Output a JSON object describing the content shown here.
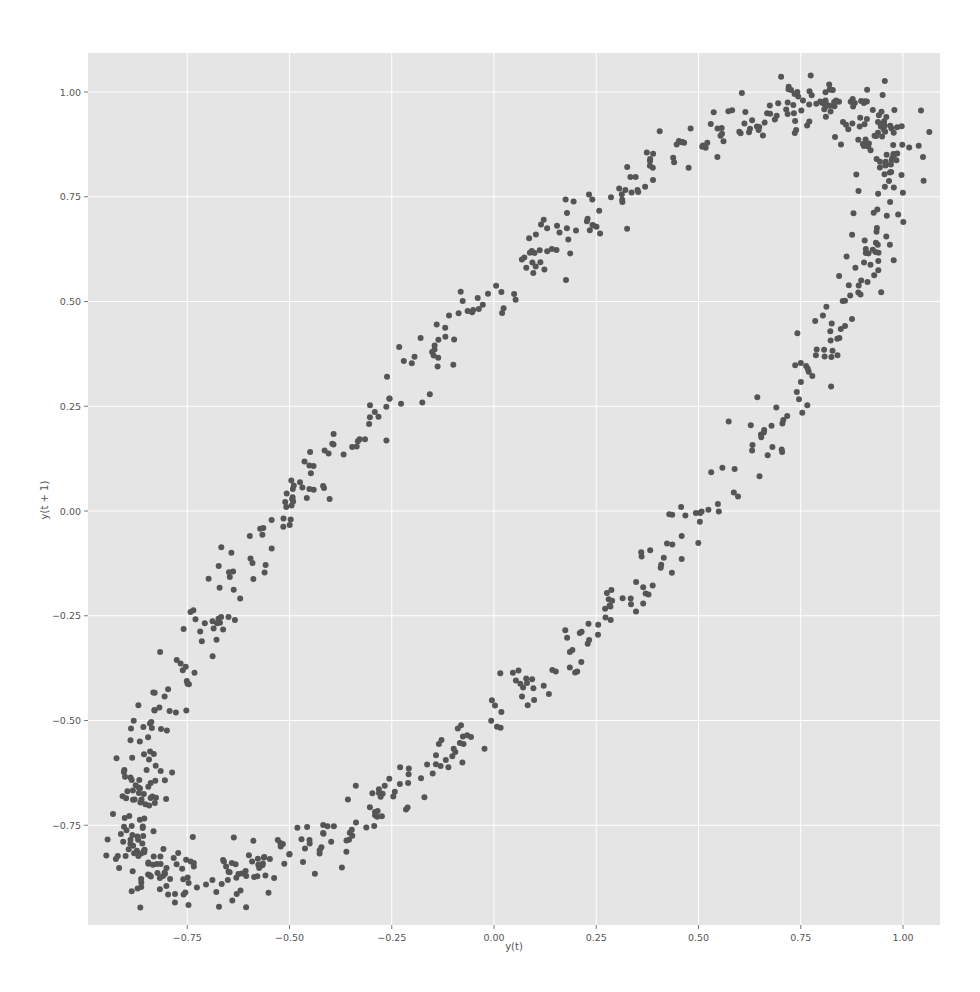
{
  "chart_data": {
    "type": "scatter",
    "title": "",
    "xlabel": "y(t)",
    "ylabel": "y(t + 1)",
    "xlim": [
      -0.96,
      1.09
    ],
    "ylim": [
      -0.98,
      1.09
    ],
    "grid": true,
    "legend": null,
    "x_ticks": [
      -0.75,
      -0.5,
      -0.25,
      0.0,
      0.25,
      0.5,
      0.75,
      1.0
    ],
    "x_tick_labels": [
      "−0.75",
      "−0.50",
      "−0.25",
      "0.00",
      "0.25",
      "0.50",
      "0.75",
      "1.00"
    ],
    "y_ticks": [
      -0.75,
      -0.5,
      -0.25,
      0.0,
      0.25,
      0.5,
      0.75,
      1.0
    ],
    "y_tick_labels": [
      "−0.75",
      "−0.50",
      "−0.25",
      "0.00",
      "0.25",
      "0.50",
      "0.75",
      "1.00"
    ],
    "series": [
      {
        "name": "lag plot",
        "description": "Lag-1 plot of a noisy sinusoid: points lie on a tilted elliptical loop, x = y(t), y = y(t+1)",
        "n_points": 800,
        "model": {
          "amplitude": 0.93,
          "x_offset": 0.04,
          "y_offset": 0.045,
          "phase_lag_rad": 0.58,
          "noise": 0.03
        },
        "key_points": [
          {
            "x": 0.82,
            "y": 0.97
          },
          {
            "x": 0.97,
            "y": 0.78
          },
          {
            "x": 0.95,
            "y": 0.5
          },
          {
            "x": 0.75,
            "y": 0.05
          },
          {
            "x": 0.5,
            "y": -0.2
          },
          {
            "x": 0.0,
            "y": -0.52
          },
          {
            "x": -0.5,
            "y": -0.82
          },
          {
            "x": -0.72,
            "y": -0.88
          },
          {
            "x": -0.87,
            "y": -0.75
          },
          {
            "x": -0.88,
            "y": -0.6
          },
          {
            "x": -0.75,
            "y": -0.25
          },
          {
            "x": -0.5,
            "y": 0.0
          },
          {
            "x": -0.25,
            "y": 0.25
          },
          {
            "x": 0.0,
            "y": 0.55
          },
          {
            "x": 0.25,
            "y": 0.75
          },
          {
            "x": 0.5,
            "y": 0.9
          }
        ]
      }
    ],
    "style": {
      "background": "#ffffff",
      "plot_background": "#e5e5e5",
      "grid_color": "#ffffff",
      "marker_color": "#555555",
      "marker_radius": 3
    }
  }
}
